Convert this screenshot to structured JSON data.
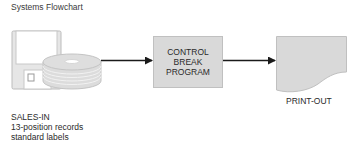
{
  "diagram": {
    "title": "Systems Flowchart",
    "input": {
      "name": "SALES-IN",
      "details": [
        "13-position records",
        "standard labels"
      ],
      "symbols": [
        "diskette-icon",
        "disk-pack-icon"
      ]
    },
    "process": {
      "lines": [
        "CONTROL",
        "BREAK",
        "PROGRAM"
      ]
    },
    "output": {
      "label": "PRINT-OUT",
      "symbol": "document-icon"
    },
    "flow": [
      {
        "from": "SALES-IN",
        "to": "CONTROL BREAK PROGRAM"
      },
      {
        "from": "CONTROL BREAK PROGRAM",
        "to": "PRINT-OUT"
      }
    ],
    "colors": {
      "fill": "#d9d9d9",
      "stroke": "#bdbdbd",
      "arrow": "#1a1a1a",
      "text": "#2a2a2a"
    }
  }
}
